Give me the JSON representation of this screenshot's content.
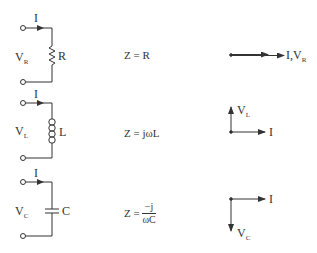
{
  "diagram": {
    "title": "",
    "rows": [
      {
        "element": "resistor",
        "current_label": "I",
        "voltage_label": {
          "main": "V",
          "sub": "R"
        },
        "component_label": "R",
        "impedance": {
          "lhs": "Z =",
          "rhs": "R"
        },
        "phasor": {
          "arrows": [
            {
              "direction": "right",
              "label": "I"
            },
            {
              "direction": "right",
              "label": "V_R"
            }
          ],
          "label_text": {
            "main": "I,V",
            "sub": "R"
          }
        }
      },
      {
        "element": "inductor",
        "current_label": "I",
        "voltage_label": {
          "main": "V",
          "sub": "L"
        },
        "component_label": "L",
        "impedance": {
          "lhs": "Z =",
          "rhs": "jωL"
        },
        "phasor": {
          "arrows": [
            {
              "direction": "up",
              "label": "V_L"
            },
            {
              "direction": "right",
              "label": "I"
            }
          ],
          "up_label": {
            "main": "V",
            "sub": "L"
          },
          "right_label": "I"
        }
      },
      {
        "element": "capacitor",
        "current_label": "I",
        "voltage_label": {
          "main": "V",
          "sub": "C"
        },
        "component_label": "C",
        "impedance": {
          "lhs": "Z =",
          "num": "−j",
          "den": "ωC"
        },
        "phasor": {
          "arrows": [
            {
              "direction": "right",
              "label": "I"
            },
            {
              "direction": "down",
              "label": "V_C"
            }
          ],
          "right_label": "I",
          "down_label": {
            "main": "V",
            "sub": "C"
          }
        }
      }
    ],
    "colors": {
      "stroke": "#333333",
      "background": "#ffffff"
    }
  }
}
